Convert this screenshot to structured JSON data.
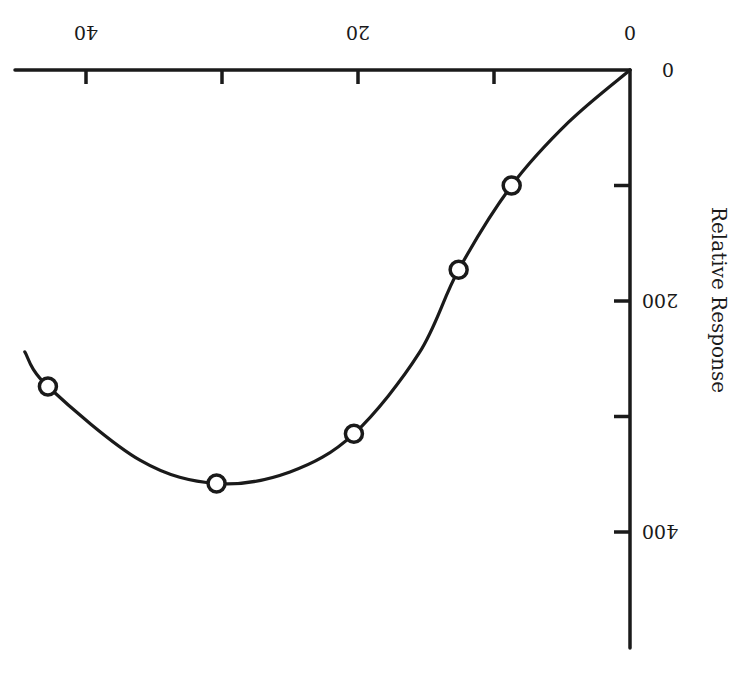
{
  "chart_data": {
    "type": "line",
    "title": "",
    "xlabel": "",
    "ylabel": "Relative Response",
    "orientation_note": "figure rendered rotated 180 degrees",
    "x_ticks": [
      0,
      10,
      20,
      30,
      40
    ],
    "x_tick_labels": [
      "0",
      "",
      "20",
      "",
      "40"
    ],
    "y_ticks": [
      0,
      100,
      200,
      300,
      400
    ],
    "y_tick_labels": [
      "0",
      "",
      "200",
      "",
      "400"
    ],
    "xlim": [
      0,
      45
    ],
    "ylim": [
      0,
      500
    ],
    "grid": false,
    "legend": null,
    "series": [
      {
        "name": "measured",
        "style": "open-circle markers",
        "points": [
          {
            "x": 8.7,
            "y": 100
          },
          {
            "x": 12.6,
            "y": 173
          },
          {
            "x": 20.3,
            "y": 315
          },
          {
            "x": 30.4,
            "y": 358
          },
          {
            "x": 42.8,
            "y": 274
          }
        ]
      },
      {
        "name": "fitted curve",
        "style": "smooth solid line",
        "points": [
          {
            "x": 0,
            "y": 0
          },
          {
            "x": 4.5,
            "y": 45
          },
          {
            "x": 8.7,
            "y": 100
          },
          {
            "x": 12.6,
            "y": 173
          },
          {
            "x": 15.5,
            "y": 245
          },
          {
            "x": 20.3,
            "y": 315
          },
          {
            "x": 25,
            "y": 348
          },
          {
            "x": 30.4,
            "y": 358
          },
          {
            "x": 36,
            "y": 338
          },
          {
            "x": 42.8,
            "y": 274
          },
          {
            "x": 44.5,
            "y": 244
          }
        ]
      }
    ]
  },
  "colors": {
    "ink": "#1a1a1a",
    "background": "#ffffff"
  }
}
